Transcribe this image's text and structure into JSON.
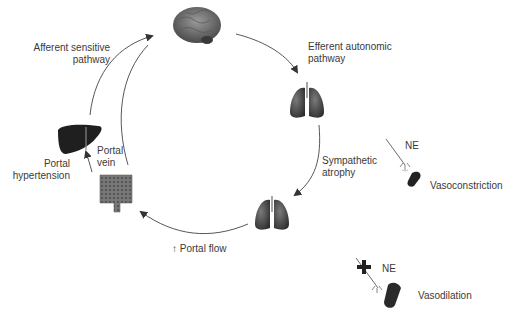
{
  "labels": {
    "afferent_line1": "Afferent sensitive",
    "afferent_line2": "pathway",
    "efferent_line1": "Efferent autonomic",
    "efferent_line2": "pathway",
    "sympathetic_line1": "Sympathetic",
    "sympathetic_line2": "atrophy",
    "portal_flow": "↑ Portal flow",
    "portal_vein_line1": "Portal",
    "portal_vein_line2": "vein",
    "portal_htn_line1": "Portal",
    "portal_htn_line2": "hypertension",
    "ne_top": "NE",
    "vasoconstriction": "Vasoconstriction",
    "ne_bottom": "NE",
    "vasodilation": "Vasodilation"
  },
  "nodes": [
    {
      "id": "brain",
      "label": "brain"
    },
    {
      "id": "lungs-top",
      "label": "lungs"
    },
    {
      "id": "lungs-bottom",
      "label": "lungs"
    },
    {
      "id": "intestine",
      "label": "intestine"
    },
    {
      "id": "liver",
      "label": "liver"
    },
    {
      "id": "vessel-constricted",
      "label": "constricted vessel"
    },
    {
      "id": "vessel-dilated",
      "label": "dilated vessel"
    }
  ],
  "colors": {
    "line": "#444444",
    "organ_dark": "#2b2b2b",
    "organ_mid": "#6e6e6e",
    "text": "#3a3a3a"
  }
}
